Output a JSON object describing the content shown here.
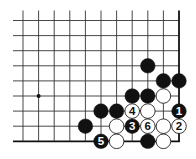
{
  "diagram": {
    "type": "go-board-fragment",
    "columns": 11,
    "rows": 9,
    "origin_x": 23,
    "origin_y": 20.5,
    "spacing_x": 15.6,
    "spacing_y": 15.1,
    "line_extend_left": 10,
    "line_extend_top": 10,
    "edge_right": true,
    "edge_bottom": true,
    "star_points": [
      {
        "col": 1,
        "row": 5
      }
    ],
    "colors": {
      "line": "#333333",
      "edge": "#111111",
      "black_stone": "#111111",
      "white_stone": "#ffffff",
      "white_stroke": "#222222",
      "background": "#ffffff"
    },
    "stones": [
      {
        "col": 8,
        "row": 3,
        "color": "black",
        "label": ""
      },
      {
        "col": 9,
        "row": 4,
        "color": "black",
        "label": ""
      },
      {
        "col": 10,
        "row": 4,
        "color": "black",
        "label": ""
      },
      {
        "col": 7,
        "row": 5,
        "color": "black",
        "label": ""
      },
      {
        "col": 8,
        "row": 5,
        "color": "black",
        "label": ""
      },
      {
        "col": 9,
        "row": 5,
        "color": "white",
        "label": ""
      },
      {
        "col": 5,
        "row": 6,
        "color": "black",
        "label": ""
      },
      {
        "col": 6,
        "row": 6,
        "color": "black",
        "label": ""
      },
      {
        "col": 7,
        "row": 6,
        "color": "white",
        "label": "4"
      },
      {
        "col": 8,
        "row": 6,
        "color": "white",
        "label": ""
      },
      {
        "col": 10,
        "row": 6,
        "color": "black",
        "label": "1"
      },
      {
        "col": 4,
        "row": 7,
        "color": "black",
        "label": ""
      },
      {
        "col": 6,
        "row": 7,
        "color": "white",
        "label": ""
      },
      {
        "col": 7,
        "row": 7,
        "color": "black",
        "label": "3"
      },
      {
        "col": 8,
        "row": 7,
        "color": "white",
        "label": "6"
      },
      {
        "col": 9,
        "row": 7,
        "color": "white",
        "label": ""
      },
      {
        "col": 10,
        "row": 7,
        "color": "white",
        "label": "2"
      },
      {
        "col": 5,
        "row": 8,
        "color": "black",
        "label": "5"
      },
      {
        "col": 6,
        "row": 8,
        "color": "white",
        "label": ""
      },
      {
        "col": 8,
        "row": 8,
        "color": "black",
        "label": ""
      },
      {
        "col": 9,
        "row": 8,
        "color": "white",
        "label": ""
      }
    ]
  }
}
